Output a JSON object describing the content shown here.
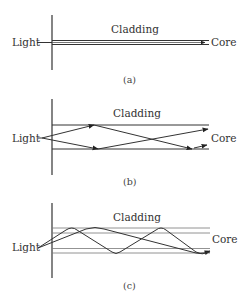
{
  "figure": {
    "panels": [
      {
        "id": "a",
        "caption": "(a)",
        "light_label": "Light",
        "cladding_label": "Cladding",
        "core_label": "Core",
        "description": "Single-mode: light travels straight along a thin core"
      },
      {
        "id": "b",
        "caption": "(b)",
        "light_label": "Light",
        "cladding_label": "Cladding",
        "core_label": "Core",
        "description": "Step-index multimode: rays reflect in zigzag paths"
      },
      {
        "id": "c",
        "caption": "(c)",
        "light_label": "Light",
        "cladding_label": "Cladding",
        "core_label": "Core",
        "description": "Graded-index multimode: rays follow curved sinusoidal paths"
      }
    ],
    "colors": {
      "line": "#333333",
      "guide_line": "#777777",
      "background": "#ffffff"
    }
  }
}
